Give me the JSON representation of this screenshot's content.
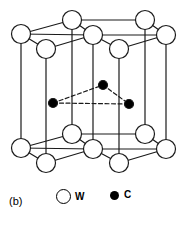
{
  "figure": {
    "panel_label": "(b)"
  },
  "legend": {
    "items": [
      {
        "symbol": "W",
        "marker": "open-circle",
        "element": "tungsten",
        "color": "#ffffff",
        "stroke": "#000000"
      },
      {
        "symbol": "C",
        "marker": "filled-circle",
        "element": "carbon",
        "color": "#000000",
        "stroke": "#000000"
      }
    ]
  },
  "style": {
    "line_color": "#1a1a1a",
    "atom_fill_open": "#ffffff",
    "atom_fill_closed": "#000000",
    "background": "#ffffff",
    "solid_line_width": 1.2,
    "dashed_pattern": "4,2.5"
  },
  "structure": {
    "tungsten_radius": 9.5,
    "carbon_radius": 4.5,
    "top_layer": [
      {
        "id": "T-back-left",
        "x": 21,
        "y": 34
      },
      {
        "id": "T-back-mid",
        "x": 72,
        "y": 20
      },
      {
        "id": "T-back-right",
        "x": 145,
        "y": 20
      },
      {
        "id": "T-center",
        "x": 93,
        "y": 35
      },
      {
        "id": "T-right",
        "x": 166,
        "y": 35
      },
      {
        "id": "T-front-left",
        "x": 46,
        "y": 49
      },
      {
        "id": "T-front-right",
        "x": 119,
        "y": 49
      }
    ],
    "bottom_layer": [
      {
        "id": "B-back-left",
        "x": 21,
        "y": 148
      },
      {
        "id": "B-back-mid",
        "x": 72,
        "y": 134
      },
      {
        "id": "B-back-right",
        "x": 145,
        "y": 134
      },
      {
        "id": "B-center",
        "x": 93,
        "y": 149
      },
      {
        "id": "B-right",
        "x": 166,
        "y": 149
      },
      {
        "id": "B-front-left",
        "x": 46,
        "y": 163
      },
      {
        "id": "B-front-right",
        "x": 119,
        "y": 163
      }
    ],
    "carbon_layer": [
      {
        "id": "C-left",
        "x": 53,
        "y": 103
      },
      {
        "id": "C-top",
        "x": 103,
        "y": 85
      },
      {
        "id": "C-right",
        "x": 129,
        "y": 104
      }
    ],
    "carbon_bonds": [
      {
        "from": "C-left",
        "to": "C-top"
      },
      {
        "from": "C-top",
        "to": "C-right"
      },
      {
        "from": "C-left",
        "to": "C-right"
      }
    ],
    "basal_edges": [
      [
        "back-left",
        "back-mid"
      ],
      [
        "back-mid",
        "center"
      ],
      [
        "back-mid",
        "back-right"
      ],
      [
        "back-right",
        "right"
      ],
      [
        "center",
        "right"
      ],
      [
        "back-left",
        "front-left"
      ],
      [
        "front-left",
        "center"
      ],
      [
        "center",
        "front-right"
      ],
      [
        "front-right",
        "right"
      ],
      [
        "back-left",
        "center"
      ]
    ],
    "vertical_edges": [
      "back-left",
      "back-mid",
      "back-right",
      "center",
      "right",
      "front-left",
      "front-right"
    ]
  }
}
